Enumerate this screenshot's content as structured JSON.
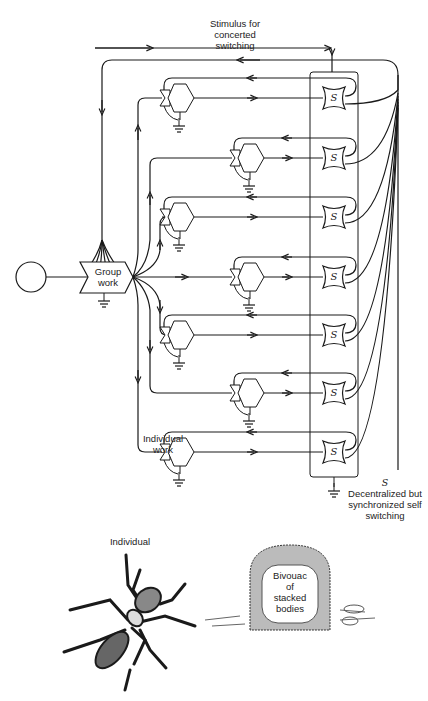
{
  "diagram": {
    "stimulus_label": [
      "Stimulus for",
      "concerted",
      "switching"
    ],
    "group_work_label": [
      "Group",
      "work"
    ],
    "individual_work_label": [
      "Individual",
      "work"
    ],
    "switch_symbol": "S",
    "switch_legend_symbol": "S",
    "switch_legend_text": [
      "Decentralized but",
      "synchronized self",
      "switching"
    ],
    "rows": [
      {
        "y": 98,
        "unit_x": 170
      },
      {
        "y": 158,
        "unit_x": 240
      },
      {
        "y": 217,
        "unit_x": 170
      },
      {
        "y": 277,
        "unit_x": 240
      },
      {
        "y": 335,
        "unit_x": 170
      },
      {
        "y": 393,
        "unit_x": 240
      },
      {
        "y": 452,
        "unit_x": 170
      }
    ]
  },
  "illustrations": {
    "ant_label": "Individual",
    "bivouac_label": [
      "Bivouac",
      "of",
      "stacked",
      "bodies"
    ]
  },
  "colors": {
    "line": "#1a1a1a",
    "background": "#ffffff"
  }
}
